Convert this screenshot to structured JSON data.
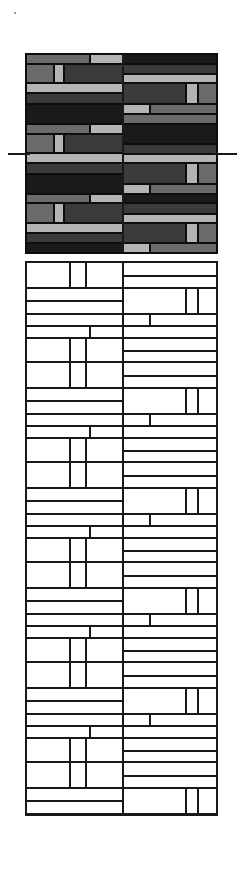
{
  "drawing": {
    "title": "Brick Coursing Elevation",
    "type": "masonry-wall-elevation",
    "canvas": {
      "width": 243,
      "height": 880,
      "background": "#ffffff"
    },
    "panels": [
      {
        "name": "tonal-sample-panel",
        "style": "filled",
        "x": 25,
        "y": 53,
        "width": 193,
        "height": 201,
        "border_color": "#0d0d0d"
      },
      {
        "name": "outline-coursing-panel",
        "style": "outline",
        "x": 25,
        "y": 261,
        "width": 193,
        "height": 555,
        "border_color": "#191919"
      }
    ],
    "datum_line": {
      "name": "datum-reference-line",
      "y": 153,
      "color": "#1a1a1a",
      "left_tick": {
        "x": 8,
        "width": 22
      },
      "right_tick": {
        "x": 212,
        "width": 25
      }
    },
    "corner_speck": {
      "x": 14,
      "y": 12,
      "color": "#9a9a9a"
    }
  },
  "palette": {
    "tone_black": "#1a1a1a",
    "tone_dark": "#3b3b3b",
    "tone_mid": "#6b6b6b",
    "tone_light": "#b4b4b4",
    "line": "#191919",
    "paper": "#ffffff"
  },
  "legend": {
    "tone_black_label": "black",
    "tone_dark_label": "dark grey",
    "tone_mid_label": "mid grey",
    "tone_light_label": "light grey"
  },
  "chart_data": {
    "type": "heatmap",
    "xlabel": "",
    "ylabel": "",
    "grid": false,
    "legend": "none",
    "note": "Two-bay brick wall elevation. Upper panel shows tonal brick distribution; lower panel repeats the same coursing as an outline line-drawing. Coordinates are percentages of each panel (x,y,w,h) with a tone key for the filled panel.",
    "bays": [
      {
        "name": "left-bay",
        "x": 0,
        "width": 50.8
      },
      {
        "name": "right-bay",
        "x": 50.8,
        "width": 49.2
      }
    ],
    "course_height_pct": 9.95,
    "tone_counts": {
      "black": 9,
      "dark": 17,
      "mid": 11,
      "light": 13
    },
    "tonal_bricks": [
      {
        "x": 0.0,
        "y": 0.0,
        "w": 33.7,
        "h": 4.9,
        "tone": "mid"
      },
      {
        "x": 33.7,
        "y": 0.0,
        "w": 17.1,
        "h": 4.9,
        "tone": "light"
      },
      {
        "x": 50.8,
        "y": 0.0,
        "w": 49.2,
        "h": 4.9,
        "tone": "black"
      },
      {
        "x": 0.0,
        "y": 4.9,
        "w": 14.5,
        "h": 9.9,
        "tone": "mid"
      },
      {
        "x": 14.5,
        "y": 4.9,
        "w": 5.2,
        "h": 9.9,
        "tone": "light"
      },
      {
        "x": 19.7,
        "y": 4.9,
        "w": 31.1,
        "h": 9.9,
        "tone": "dark"
      },
      {
        "x": 50.8,
        "y": 4.9,
        "w": 49.2,
        "h": 5.4,
        "tone": "dark"
      },
      {
        "x": 50.8,
        "y": 10.3,
        "w": 49.2,
        "h": 4.5,
        "tone": "light"
      },
      {
        "x": 0.0,
        "y": 14.8,
        "w": 50.8,
        "h": 4.9,
        "tone": "light"
      },
      {
        "x": 0.0,
        "y": 19.7,
        "w": 50.8,
        "h": 5.5,
        "tone": "dark"
      },
      {
        "x": 50.8,
        "y": 14.8,
        "w": 33.1,
        "h": 10.4,
        "tone": "dark"
      },
      {
        "x": 83.9,
        "y": 14.8,
        "w": 6.2,
        "h": 10.4,
        "tone": "light"
      },
      {
        "x": 90.1,
        "y": 14.8,
        "w": 9.9,
        "h": 10.4,
        "tone": "mid"
      },
      {
        "x": 0.0,
        "y": 25.2,
        "w": 50.8,
        "h": 9.9,
        "tone": "black"
      },
      {
        "x": 50.8,
        "y": 25.2,
        "w": 14.0,
        "h": 4.9,
        "tone": "light"
      },
      {
        "x": 64.8,
        "y": 25.2,
        "w": 35.2,
        "h": 4.9,
        "tone": "mid"
      },
      {
        "x": 50.8,
        "y": 30.1,
        "w": 49.2,
        "h": 5.0,
        "tone": "mid"
      },
      {
        "x": 0.0,
        "y": 35.1,
        "w": 33.7,
        "h": 4.9,
        "tone": "mid"
      },
      {
        "x": 33.7,
        "y": 35.1,
        "w": 17.1,
        "h": 4.9,
        "tone": "light"
      },
      {
        "x": 50.8,
        "y": 35.1,
        "w": 49.2,
        "h": 9.9,
        "tone": "black"
      },
      {
        "x": 0.0,
        "y": 40.0,
        "w": 14.5,
        "h": 9.9,
        "tone": "mid"
      },
      {
        "x": 14.5,
        "y": 40.0,
        "w": 5.2,
        "h": 9.9,
        "tone": "light"
      },
      {
        "x": 19.7,
        "y": 40.0,
        "w": 31.1,
        "h": 9.9,
        "tone": "dark"
      },
      {
        "x": 50.8,
        "y": 45.0,
        "w": 49.2,
        "h": 5.4,
        "tone": "dark"
      },
      {
        "x": 0.0,
        "y": 49.9,
        "w": 50.8,
        "h": 4.9,
        "tone": "light"
      },
      {
        "x": 50.8,
        "y": 50.4,
        "w": 49.2,
        "h": 4.5,
        "tone": "light"
      },
      {
        "x": 0.0,
        "y": 54.8,
        "w": 50.8,
        "h": 5.5,
        "tone": "dark"
      },
      {
        "x": 50.8,
        "y": 54.9,
        "w": 33.1,
        "h": 10.4,
        "tone": "dark"
      },
      {
        "x": 83.9,
        "y": 54.9,
        "w": 6.2,
        "h": 10.4,
        "tone": "light"
      },
      {
        "x": 90.1,
        "y": 54.9,
        "w": 9.9,
        "h": 10.4,
        "tone": "mid"
      },
      {
        "x": 0.0,
        "y": 60.3,
        "w": 50.8,
        "h": 9.9,
        "tone": "black"
      },
      {
        "x": 50.8,
        "y": 65.3,
        "w": 14.0,
        "h": 4.9,
        "tone": "light"
      },
      {
        "x": 64.8,
        "y": 65.3,
        "w": 35.2,
        "h": 4.9,
        "tone": "mid"
      },
      {
        "x": 0.0,
        "y": 70.2,
        "w": 33.7,
        "h": 4.9,
        "tone": "mid"
      },
      {
        "x": 33.7,
        "y": 70.2,
        "w": 17.1,
        "h": 4.9,
        "tone": "light"
      },
      {
        "x": 50.8,
        "y": 70.2,
        "w": 49.2,
        "h": 4.9,
        "tone": "black"
      },
      {
        "x": 0.0,
        "y": 75.1,
        "w": 14.5,
        "h": 9.9,
        "tone": "mid"
      },
      {
        "x": 14.5,
        "y": 75.1,
        "w": 5.2,
        "h": 9.9,
        "tone": "light"
      },
      {
        "x": 19.7,
        "y": 75.1,
        "w": 31.1,
        "h": 9.9,
        "tone": "dark"
      },
      {
        "x": 50.8,
        "y": 75.1,
        "w": 49.2,
        "h": 5.4,
        "tone": "dark"
      },
      {
        "x": 50.8,
        "y": 80.5,
        "w": 49.2,
        "h": 4.5,
        "tone": "light"
      },
      {
        "x": 0.0,
        "y": 85.0,
        "w": 50.8,
        "h": 4.9,
        "tone": "light"
      },
      {
        "x": 0.0,
        "y": 89.9,
        "w": 50.8,
        "h": 5.3,
        "tone": "dark"
      },
      {
        "x": 50.8,
        "y": 85.0,
        "w": 33.1,
        "h": 10.2,
        "tone": "dark"
      },
      {
        "x": 83.9,
        "y": 85.0,
        "w": 6.2,
        "h": 10.2,
        "tone": "light"
      },
      {
        "x": 90.1,
        "y": 85.0,
        "w": 9.9,
        "h": 10.2,
        "tone": "mid"
      },
      {
        "x": 0.0,
        "y": 95.2,
        "w": 50.8,
        "h": 4.8,
        "tone": "black"
      },
      {
        "x": 50.8,
        "y": 95.2,
        "w": 14.0,
        "h": 4.8,
        "tone": "light"
      },
      {
        "x": 64.8,
        "y": 95.2,
        "w": 35.2,
        "h": 4.8,
        "tone": "mid"
      }
    ],
    "outline_tile": {
      "note": "One vertical repeat of the coursing, expressed in % of tile width and tile height. The tile is stacked 5.55 times down the outline panel.",
      "tile_height_px": 100,
      "bricks": [
        {
          "x": 0.0,
          "y": 0.0,
          "w": 50.8,
          "h": 26.0
        },
        {
          "x": 0.0,
          "y": 0.0,
          "w": 23.0,
          "h": 26.0
        },
        {
          "x": 23.0,
          "y": 0.0,
          "w": 8.5,
          "h": 26.0
        },
        {
          "x": 31.5,
          "y": 0.0,
          "w": 19.3,
          "h": 26.0
        },
        {
          "x": 50.8,
          "y": 0.0,
          "w": 49.2,
          "h": 14.0
        },
        {
          "x": 50.8,
          "y": 14.0,
          "w": 49.2,
          "h": 12.0
        },
        {
          "x": 0.0,
          "y": 26.0,
          "w": 50.8,
          "h": 13.0
        },
        {
          "x": 0.0,
          "y": 39.0,
          "w": 50.8,
          "h": 13.0
        },
        {
          "x": 50.8,
          "y": 26.0,
          "w": 33.1,
          "h": 26.0
        },
        {
          "x": 83.9,
          "y": 26.0,
          "w": 6.2,
          "h": 26.0
        },
        {
          "x": 90.1,
          "y": 26.0,
          "w": 9.9,
          "h": 26.0
        },
        {
          "x": 0.0,
          "y": 52.0,
          "w": 50.8,
          "h": 12.0
        },
        {
          "x": 50.8,
          "y": 52.0,
          "w": 14.0,
          "h": 12.0
        },
        {
          "x": 64.8,
          "y": 52.0,
          "w": 35.2,
          "h": 12.0
        },
        {
          "x": 0.0,
          "y": 64.0,
          "w": 33.7,
          "h": 12.0
        },
        {
          "x": 33.7,
          "y": 64.0,
          "w": 17.1,
          "h": 12.0
        },
        {
          "x": 50.8,
          "y": 64.0,
          "w": 49.2,
          "h": 12.0
        },
        {
          "x": 0.0,
          "y": 76.0,
          "w": 23.0,
          "h": 24.0
        },
        {
          "x": 23.0,
          "y": 76.0,
          "w": 8.5,
          "h": 24.0
        },
        {
          "x": 31.5,
          "y": 76.0,
          "w": 19.3,
          "h": 24.0
        },
        {
          "x": 50.8,
          "y": 76.0,
          "w": 49.2,
          "h": 13.0
        },
        {
          "x": 50.8,
          "y": 89.0,
          "w": 49.2,
          "h": 11.0
        }
      ]
    }
  }
}
